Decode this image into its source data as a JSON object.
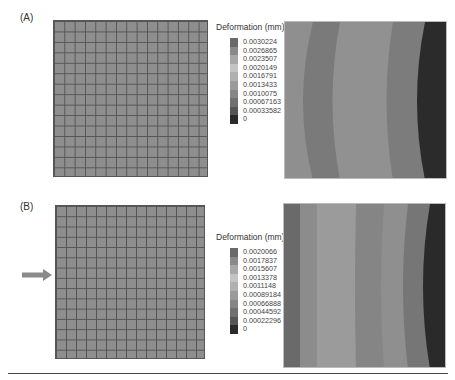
{
  "figure": {
    "panels": [
      {
        "label": "(A)",
        "mesh": {
          "rows": 15,
          "cols": 15
        },
        "legend": {
          "title": "Deformation (mm)",
          "values": [
            "0.0030224",
            "0.0026865",
            "0.0023507",
            "0.0020149",
            "0.0016791",
            "0.0013433",
            "0.0010075",
            "0.00067163",
            "0.00033582",
            "0"
          ],
          "colors": [
            "#6a6a6a",
            "#8a8a8a",
            "#a8a8a8",
            "#c4c4c4",
            "#b0b0b0",
            "#9a9a9a",
            "#868686",
            "#707070",
            "#565656",
            "#2a2a2a"
          ]
        }
      },
      {
        "label": "(B)",
        "mesh": {
          "rows": 15,
          "cols": 15
        },
        "load_arrow": "arrow-right-icon",
        "legend": {
          "title": "Deformation (mm)",
          "values": [
            "0.0020066",
            "0.0017837",
            "0.0015607",
            "0.0013378",
            "0.0011148",
            "0.00089184",
            "0.00066888",
            "0.00044592",
            "0.00022296",
            "0"
          ],
          "colors": [
            "#6a6a6a",
            "#8a8a8a",
            "#a8a8a8",
            "#c4c4c4",
            "#b0b0b0",
            "#9a9a9a",
            "#868686",
            "#707070",
            "#565656",
            "#2a2a2a"
          ]
        }
      }
    ]
  }
}
